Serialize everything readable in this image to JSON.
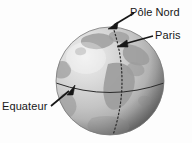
{
  "figure": {
    "background_color": "#fdfdfd",
    "ink_color": "#171717"
  },
  "globe": {
    "name": "earth-globe",
    "center_x": 110,
    "center_y": 81,
    "radius": 54,
    "ocean_color_light": "#dedede",
    "ocean_color_mid": "#bdbdbd",
    "ocean_color_dark": "#8f8f8f",
    "land_color": "#9a9a9a",
    "outline_color": "#6e6e6e",
    "highlight_x": 84,
    "highlight_y": 58
  },
  "lines": {
    "equator": {
      "label": "equator-line",
      "style": "solid",
      "color": "#2b2b2b"
    },
    "meridian": {
      "label": "paris-meridian-line",
      "style": "dotted",
      "color": "#2b2b2b"
    }
  },
  "labels": [
    {
      "id": "pole-nord",
      "text": "Pôle Nord",
      "arrow_from_x": 134,
      "arrow_from_y": 14,
      "arrow_to_x": 110,
      "arrow_to_y": 28
    },
    {
      "id": "paris",
      "text": "Paris",
      "arrow_from_x": 152,
      "arrow_from_y": 37,
      "arrow_to_x": 119,
      "arrow_to_y": 47
    },
    {
      "id": "equateur",
      "text": "Equateur",
      "arrow_from_x": 52,
      "arrow_from_y": 105,
      "arrow_to_x": 74,
      "arrow_to_y": 86
    }
  ]
}
